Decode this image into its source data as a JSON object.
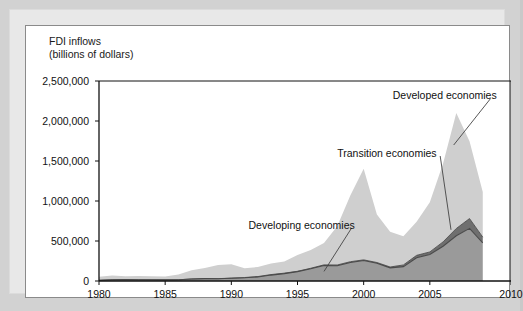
{
  "figure": {
    "axis_title_line1": "FDI inflows",
    "axis_title_line2": "(billions of dollars)"
  },
  "chart_data": {
    "type": "area",
    "stacked": true,
    "xlabel": "",
    "ylabel": "FDI inflows (billions of dollars)",
    "xlim": [
      1980,
      2010
    ],
    "ylim": [
      0,
      2500000
    ],
    "grid": false,
    "legend_position": "annotations-on-plot",
    "xticks": [
      "1980",
      "1985",
      "1990",
      "1995",
      "2000",
      "2005",
      "2010"
    ],
    "xtick_values": [
      1980,
      1985,
      1990,
      1995,
      2000,
      2005,
      2010
    ],
    "yticks": [
      "0",
      "500,000",
      "1,000,000",
      "1,500,000",
      "2,000,000",
      "2,500,000"
    ],
    "ytick_values": [
      0,
      500000,
      1000000,
      1500000,
      2000000,
      2500000
    ],
    "x": [
      1980,
      1981,
      1982,
      1983,
      1984,
      1985,
      1986,
      1987,
      1988,
      1989,
      1990,
      1991,
      1992,
      1993,
      1994,
      1995,
      1996,
      1997,
      1998,
      1999,
      2000,
      2001,
      2002,
      2003,
      2004,
      2005,
      2006,
      2007,
      2008,
      2009
    ],
    "series": [
      {
        "name": "Developing economies",
        "color": "#9a9a9a",
        "stack_order": 1,
        "values": [
          8000,
          16000,
          18000,
          16000,
          15000,
          14000,
          15000,
          25000,
          30000,
          29000,
          35000,
          41000,
          51000,
          74000,
          92000,
          117000,
          153000,
          193000,
          191000,
          232000,
          257000,
          221000,
          164000,
          180000,
          290000,
          332000,
          434000,
          565000,
          658000,
          478000
        ]
      },
      {
        "name": "Transition economies",
        "color": "#6f6f6f",
        "stack_order": 2,
        "values": [
          0,
          0,
          0,
          0,
          0,
          0,
          0,
          0,
          0,
          300,
          1100,
          2400,
          4400,
          6300,
          5900,
          4100,
          6100,
          8600,
          9000,
          9300,
          7100,
          9900,
          11100,
          20200,
          30400,
          31100,
          54600,
          90900,
          122600,
          69900
        ]
      },
      {
        "name": "Developed economies",
        "color": "#cfcfcf",
        "stack_order": 3,
        "values": [
          46600,
          53900,
          40400,
          45000,
          45000,
          43400,
          65000,
          108000,
          131000,
          172000,
          172000,
          115000,
          120000,
          138000,
          145000,
          205000,
          228000,
          272000,
          483000,
          830000,
          1138000,
          601000,
          441000,
          359000,
          419000,
          622000,
          979000,
          1444000,
          965000,
          566000
        ]
      }
    ],
    "annotations": [
      {
        "text": "Developed economies",
        "x": 2002.2,
        "y": 2320000
      },
      {
        "text": "Transition economies",
        "x": 1998.0,
        "y": 1600000
      },
      {
        "text": "Developing economies",
        "x": 1991.3,
        "y": 700000
      }
    ]
  }
}
